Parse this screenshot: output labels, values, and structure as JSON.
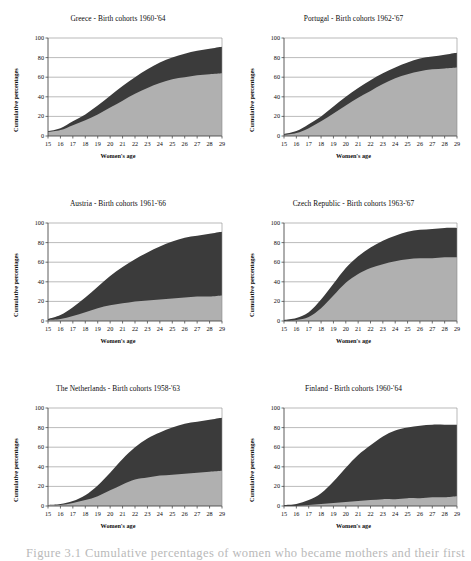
{
  "figure": {
    "caption": "Figure 3.1 Cumulative percentages of women who became mothers and their first"
  },
  "axes_common": {
    "xlabel": "Women's age",
    "ylabel": "Cumulative percentages",
    "x_ticks": [
      "15",
      "16",
      "17",
      "18",
      "19",
      "20",
      "21",
      "22",
      "23",
      "24",
      "25",
      "26",
      "27",
      "28",
      "29"
    ],
    "y_ticks": [
      "0",
      "20",
      "40",
      "60",
      "80",
      "100"
    ],
    "colors": {
      "lower_band": "#b0b0b0",
      "upper_band": "#3b3b3b",
      "axis": "#4a4a4a",
      "grid": "#8c8c8c",
      "plot_background": "#ffffff"
    }
  },
  "chart_data": [
    {
      "type": "area",
      "id": "greece",
      "title": "Greece - Birth cohorts 1960-'64",
      "xlabel": "Women's age",
      "ylabel": "Cumulative percentages",
      "xlim": [
        15,
        29
      ],
      "ylim": [
        0,
        100
      ],
      "grid": true,
      "legend": "none",
      "x": [
        15,
        16,
        17,
        18,
        19,
        20,
        21,
        22,
        23,
        24,
        25,
        26,
        27,
        28,
        29
      ],
      "series": [
        {
          "name": "lower band",
          "values": [
            4,
            6,
            11,
            16,
            22,
            29,
            36,
            43,
            49,
            54,
            58,
            60,
            62,
            63,
            64
          ]
        },
        {
          "name": "upper band (total)",
          "values": [
            5,
            8,
            15,
            22,
            31,
            41,
            51,
            60,
            68,
            75,
            80,
            84,
            87,
            89,
            91
          ]
        }
      ]
    },
    {
      "type": "area",
      "id": "portugal",
      "title": "Portugal - Birth cohorts 1962-'67",
      "xlabel": "Women's age",
      "ylabel": "Cumulative percentages",
      "xlim": [
        15,
        29
      ],
      "ylim": [
        0,
        100
      ],
      "grid": true,
      "legend": "none",
      "x": [
        15,
        16,
        17,
        18,
        19,
        20,
        21,
        22,
        23,
        24,
        25,
        26,
        27,
        28,
        29
      ],
      "series": [
        {
          "name": "lower band",
          "values": [
            1,
            3,
            8,
            15,
            23,
            31,
            39,
            46,
            53,
            59,
            63,
            66,
            68,
            69,
            70
          ]
        },
        {
          "name": "upper band (total)",
          "values": [
            2,
            5,
            12,
            20,
            30,
            40,
            49,
            57,
            64,
            70,
            75,
            79,
            81,
            83,
            85
          ]
        }
      ]
    },
    {
      "type": "area",
      "id": "austria",
      "title": "Austria - Birth cohorts 1961-'66",
      "xlabel": "Women's age",
      "ylabel": "Cumulative percentages",
      "xlim": [
        15,
        29
      ],
      "ylim": [
        0,
        100
      ],
      "grid": true,
      "legend": "none",
      "x": [
        15,
        16,
        17,
        18,
        19,
        20,
        21,
        22,
        23,
        24,
        25,
        26,
        27,
        28,
        29
      ],
      "series": [
        {
          "name": "lower band",
          "values": [
            1,
            2,
            5,
            9,
            13,
            16,
            18,
            20,
            21,
            22,
            23,
            24,
            25,
            25,
            26
          ]
        },
        {
          "name": "upper band (total)",
          "values": [
            2,
            6,
            14,
            24,
            35,
            46,
            55,
            63,
            70,
            76,
            81,
            85,
            87,
            89,
            91
          ]
        }
      ]
    },
    {
      "type": "area",
      "id": "czech-republic",
      "title": "Czech Republic - Birth cohorts 1963-'67",
      "xlabel": "Women's age",
      "ylabel": "Cumulative percentages",
      "xlim": [
        15,
        29
      ],
      "ylim": [
        0,
        100
      ],
      "grid": true,
      "legend": "none",
      "x": [
        15,
        16,
        17,
        18,
        19,
        20,
        21,
        22,
        23,
        24,
        25,
        26,
        27,
        28,
        29
      ],
      "series": [
        {
          "name": "lower band",
          "values": [
            0,
            1,
            4,
            13,
            26,
            39,
            48,
            54,
            58,
            61,
            63,
            64,
            64,
            65,
            65
          ]
        },
        {
          "name": "upper band (total)",
          "values": [
            1,
            3,
            9,
            22,
            38,
            54,
            66,
            75,
            82,
            87,
            91,
            93,
            94,
            95,
            95
          ]
        }
      ]
    },
    {
      "type": "area",
      "id": "the-netherlands",
      "title": "The Netherlands - Birth cohorts 1958-'63",
      "xlabel": "Women's age",
      "ylabel": "Cumulative percentages",
      "xlim": [
        15,
        29
      ],
      "ylim": [
        0,
        100
      ],
      "grid": true,
      "legend": "none",
      "x": [
        15,
        16,
        17,
        18,
        19,
        20,
        21,
        22,
        23,
        24,
        25,
        26,
        27,
        28,
        29
      ],
      "series": [
        {
          "name": "lower band",
          "values": [
            1,
            1,
            3,
            6,
            10,
            16,
            22,
            27,
            29,
            31,
            32,
            33,
            34,
            35,
            36
          ]
        },
        {
          "name": "upper band (total)",
          "values": [
            1,
            2,
            5,
            11,
            21,
            34,
            48,
            60,
            69,
            75,
            80,
            84,
            86,
            88,
            90
          ]
        }
      ]
    },
    {
      "type": "area",
      "id": "finland",
      "title": "Finland - Birth cohorts 1960-'64",
      "xlabel": "Women's age",
      "ylabel": "Cumulative percentages",
      "xlim": [
        15,
        29
      ],
      "ylim": [
        0,
        100
      ],
      "grid": true,
      "legend": "none",
      "x": [
        15,
        16,
        17,
        18,
        19,
        20,
        21,
        22,
        23,
        24,
        25,
        26,
        27,
        28,
        29
      ],
      "series": [
        {
          "name": "lower band",
          "values": [
            0,
            0,
            1,
            2,
            3,
            4,
            5,
            6,
            7,
            7,
            8,
            8,
            9,
            9,
            10
          ]
        },
        {
          "name": "upper band (total)",
          "values": [
            1,
            2,
            6,
            13,
            25,
            39,
            52,
            62,
            71,
            77,
            80,
            82,
            83,
            83,
            83
          ]
        }
      ]
    }
  ]
}
